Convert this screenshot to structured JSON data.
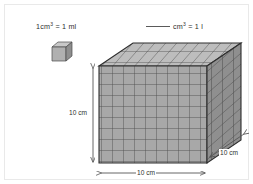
{
  "worksheet": {
    "equation_left": {
      "value": "1",
      "unit": "cm",
      "exponent": "3",
      "equals": "=",
      "result": "1 ml",
      "full_text": "1 cm³ = 1 ml"
    },
    "equation_right": {
      "blank": "",
      "unit": "cm",
      "exponent": "3",
      "equals": "=",
      "result": "1 l",
      "full_text": "____ cm³ = 1 l"
    },
    "small_cube": {
      "label": "unit-cube",
      "units_per_edge": 1,
      "face_color": "#b0b0b0",
      "top_color": "#c8c8c8",
      "side_color": "#8e8e8e",
      "edge_color": "#4a4a4a"
    },
    "large_cube": {
      "label": "thousand-block",
      "units_per_edge": 10,
      "total_units": 1000,
      "face_color": "#a8a8a8",
      "top_color": "#bdbdbd",
      "side_color": "#8f8f8f",
      "grid_color": "#4d4d4d",
      "edge_color": "#2e2e2e"
    },
    "dimensions": {
      "height": "10 cm",
      "width": "10 cm",
      "depth": "10 cm"
    },
    "colors": {
      "background": "#ffffff",
      "border": "#e9e9e9",
      "text": "#2c2c2c",
      "arrow": "#555555"
    }
  }
}
